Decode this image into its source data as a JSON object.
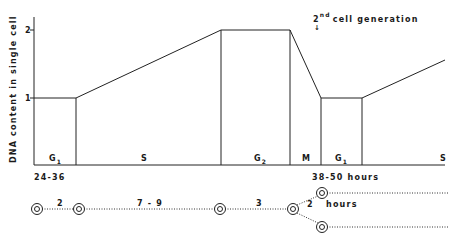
{
  "diagram": {
    "y_axis_label": "DNA content in single cell",
    "y_ticks": [
      "2",
      "1"
    ],
    "phases": [
      {
        "name": "G",
        "sub": "1"
      },
      {
        "name": "S",
        "sub": ""
      },
      {
        "name": "G",
        "sub": "2"
      },
      {
        "name": "M",
        "sub": ""
      },
      {
        "name": "G",
        "sub": "1"
      },
      {
        "name": "S",
        "sub": ""
      }
    ],
    "first_duration": "24-36",
    "second_duration": "38-50  hours",
    "annotation": {
      "base": "2",
      "superscript": "nd",
      "text": "cell  generation",
      "arrow": "↓"
    },
    "timeline": {
      "intervals": [
        "2",
        "7 - 9",
        "3",
        "2"
      ],
      "unit": "hours"
    }
  }
}
